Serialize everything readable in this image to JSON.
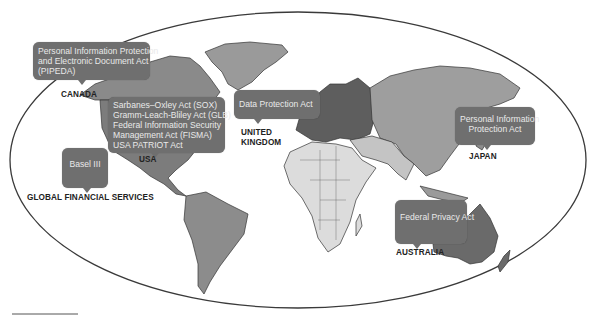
{
  "diagram": {
    "title": "",
    "colors": {
      "ellipse_stroke": "#3a3a3a",
      "callout_bg": "#6f6f6f",
      "callout_text": "#e9e9e9",
      "land_light": "#dcdcdc",
      "land_mid": "#9a9a9a",
      "land_dark": "#6e6e6e",
      "label_text": "#222222"
    },
    "callouts": [
      {
        "id": "canada",
        "lines": [
          "Personal Information Protection",
          "and Electronic Document Act",
          "(PIPEDA)"
        ]
      },
      {
        "id": "usa",
        "lines": [
          "Sarbanes–Oxley Act (SOX)",
          "Gramm-Leach-Bliley Act (GLB)",
          "Federal Information Security",
          "Management Act (FISMA)",
          "USA PATRIOT Act"
        ]
      },
      {
        "id": "global",
        "lines": [
          "Basel III"
        ]
      },
      {
        "id": "uk",
        "lines": [
          "Data Protection Act"
        ]
      },
      {
        "id": "japan",
        "lines": [
          "Personal Information",
          "Protection Act"
        ]
      },
      {
        "id": "australia",
        "lines": [
          "Federal Privacy Act"
        ]
      }
    ],
    "region_labels": {
      "canada": "CANADA",
      "usa": "USA",
      "global": "GLOBAL FINANCIAL SERVICES",
      "uk_line1": "UNITED",
      "uk_line2": "KINGDOM",
      "japan": "JAPAN",
      "australia": "AUSTRALIA"
    }
  }
}
